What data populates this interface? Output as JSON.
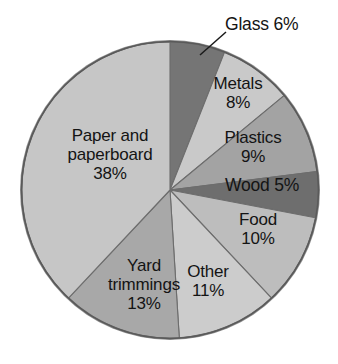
{
  "chart_data": {
    "type": "pie",
    "title": "",
    "subtitle": "",
    "xlabel": "",
    "ylabel": "",
    "units": "percent",
    "total": 100,
    "legend_position": "none",
    "labels_position": "inside-slices-with-callout-for-glass",
    "grid": false,
    "start_angle_deg": 0,
    "direction": "clockwise",
    "categories": [
      "Glass",
      "Metals",
      "Plastics",
      "Wood",
      "Food",
      "Other",
      "Yard trimmings",
      "Paper and paperboard"
    ],
    "values": [
      6,
      8,
      9,
      5,
      10,
      11,
      13,
      38
    ],
    "slices": [
      {
        "name": "Glass",
        "value": 6,
        "value_text": "6%",
        "label_text": "Glass 6%",
        "color": "#757575",
        "callout": true
      },
      {
        "name": "Metals",
        "value": 8,
        "value_text": "8%",
        "label_line1": "Metals",
        "label_line2": "8%",
        "color": "#c9c9c9",
        "callout": false
      },
      {
        "name": "Plastics",
        "value": 9,
        "value_text": "9%",
        "label_line1": "Plastics",
        "label_line2": "9%",
        "color": "#a3a3a3",
        "callout": false
      },
      {
        "name": "Wood",
        "value": 5,
        "value_text": "5%",
        "label_text": "Wood 5%",
        "color": "#6e6e6e",
        "callout": false
      },
      {
        "name": "Food",
        "value": 10,
        "value_text": "10%",
        "label_line1": "Food",
        "label_line2": "10%",
        "color": "#bdbdbd",
        "callout": false
      },
      {
        "name": "Other",
        "value": 11,
        "value_text": "11%",
        "label_line1": "Other",
        "label_line2": "11%",
        "color": "#cccccc",
        "callout": false
      },
      {
        "name": "Yard trimmings",
        "value": 13,
        "value_text": "13%",
        "label_line1": "Yard",
        "label_line2": "trimmings",
        "label_line3": "13%",
        "color": "#a8a8a8",
        "callout": false
      },
      {
        "name": "Paper and paperboard",
        "value": 38,
        "value_text": "38%",
        "label_line1": "Paper and",
        "label_line2": "paperboard",
        "label_line3": "38%",
        "color": "#c6c6c6",
        "callout": false
      }
    ],
    "colors": {
      "glass": "#757575",
      "metals": "#c9c9c9",
      "plastics": "#a3a3a3",
      "wood": "#6e6e6e",
      "food": "#bdbdbd",
      "other": "#cccccc",
      "yard_trimmings": "#a8a8a8",
      "paper_and_paperboard": "#c6c6c6",
      "outline": "#5a5a5a",
      "rim_shadow": "#8a8a8a",
      "text": "#141414",
      "background": "#ffffff"
    }
  }
}
